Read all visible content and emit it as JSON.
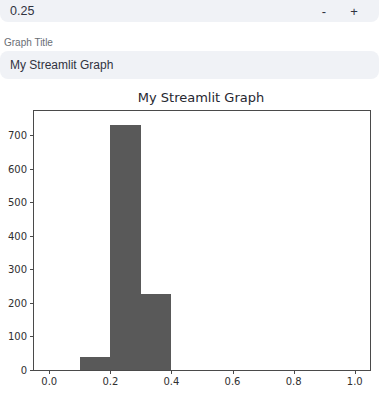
{
  "number_input": {
    "value": "0.25",
    "decrement_label": "-",
    "increment_label": "+"
  },
  "text_input": {
    "label": "Graph Title",
    "value": "My Streamlit Graph"
  },
  "colors": {
    "widget_bg": "#f0f2f6",
    "text": "#31333f",
    "label": "#696e75",
    "axis": "#4a4a4a",
    "bar": "#595959"
  },
  "chart_data": {
    "type": "bar",
    "subtype": "histogram",
    "title": "My Streamlit Graph",
    "xlabel": "",
    "ylabel": "",
    "bins": [
      {
        "x0": 0.1,
        "x1": 0.2,
        "count": 40
      },
      {
        "x0": 0.2,
        "x1": 0.3,
        "count": 730
      },
      {
        "x0": 0.3,
        "x1": 0.4,
        "count": 228
      }
    ],
    "xlim": [
      -0.05,
      1.05
    ],
    "ylim": [
      0,
      772
    ],
    "xticks": [
      {
        "v": 0.0,
        "label": "0.0"
      },
      {
        "v": 0.2,
        "label": "0.2"
      },
      {
        "v": 0.4,
        "label": "0.4"
      },
      {
        "v": 0.6,
        "label": "0.6"
      },
      {
        "v": 0.8,
        "label": "0.8"
      },
      {
        "v": 1.0,
        "label": "1.0"
      }
    ],
    "yticks": [
      {
        "v": 0,
        "label": "0"
      },
      {
        "v": 100,
        "label": "100"
      },
      {
        "v": 200,
        "label": "200"
      },
      {
        "v": 300,
        "label": "300"
      },
      {
        "v": 400,
        "label": "400"
      },
      {
        "v": 500,
        "label": "500"
      },
      {
        "v": 600,
        "label": "600"
      },
      {
        "v": 700,
        "label": "700"
      }
    ],
    "bar_color": "#595959",
    "grid": false,
    "legend": null
  }
}
